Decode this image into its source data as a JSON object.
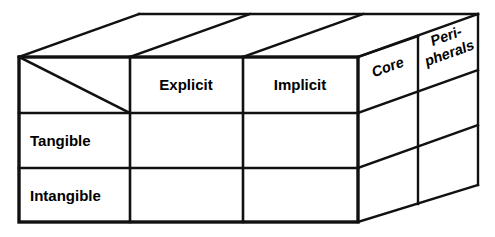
{
  "diagram": {
    "type": "3d-matrix-cube",
    "background_color": "#ffffff",
    "line_color": "#111111",
    "text_color": "#000000",
    "column_headers": [
      {
        "id": "corner",
        "label": ""
      },
      {
        "id": "explicit",
        "label": "Explicit"
      },
      {
        "id": "implicit",
        "label": "Implicit"
      }
    ],
    "row_headers": [
      {
        "id": "tangible",
        "label": "Tangible"
      },
      {
        "id": "intangible",
        "label": "Intangible"
      }
    ],
    "depth_headers": [
      {
        "id": "core",
        "label": "Core"
      },
      {
        "id": "peripherals",
        "label_line1": "Peri-",
        "label_line2": "pherals"
      }
    ],
    "corner_cell": {
      "has_diagonal": true,
      "label": ""
    },
    "grid": {
      "front_columns": 3,
      "front_rows": 3,
      "depth_slices": 2
    },
    "cells": [
      {
        "row": "tangible",
        "column": "explicit",
        "value": ""
      },
      {
        "row": "tangible",
        "column": "implicit",
        "value": ""
      },
      {
        "row": "intangible",
        "column": "explicit",
        "value": ""
      },
      {
        "row": "intangible",
        "column": "implicit",
        "value": ""
      }
    ]
  }
}
